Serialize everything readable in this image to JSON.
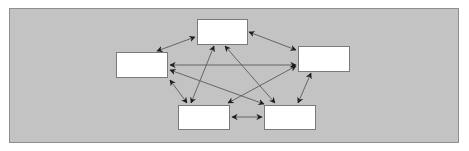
{
  "diagram": {
    "type": "fully-connected-network",
    "background_color": "#c3c3c3",
    "node_fill": "#ffffff",
    "edge_color": "#555555",
    "nodes": [
      {
        "id": "top",
        "label": "",
        "x": 197,
        "y": 19,
        "w": 51,
        "h": 26
      },
      {
        "id": "left",
        "label": "",
        "x": 116,
        "y": 52,
        "w": 52,
        "h": 26
      },
      {
        "id": "right",
        "label": "",
        "x": 298,
        "y": 46,
        "w": 52,
        "h": 26
      },
      {
        "id": "bottom-left",
        "label": "",
        "x": 178,
        "y": 105,
        "w": 52,
        "h": 25
      },
      {
        "id": "bottom-right",
        "label": "",
        "x": 264,
        "y": 105,
        "w": 52,
        "h": 25
      }
    ],
    "edges": [
      {
        "from": "top",
        "to": "left",
        "direction": "both"
      },
      {
        "from": "top",
        "to": "right",
        "direction": "both"
      },
      {
        "from": "left",
        "to": "bottom-left",
        "direction": "both"
      },
      {
        "from": "right",
        "to": "bottom-right",
        "direction": "both"
      },
      {
        "from": "bottom-left",
        "to": "bottom-right",
        "direction": "both"
      },
      {
        "from": "right",
        "to": "left",
        "direction": "both"
      },
      {
        "from": "bottom-left",
        "to": "top",
        "direction": "both"
      },
      {
        "from": "top",
        "to": "bottom-right",
        "direction": "both"
      },
      {
        "from": "left",
        "to": "bottom-right",
        "direction": "both"
      },
      {
        "from": "bottom-left",
        "to": "right",
        "direction": "both"
      }
    ]
  }
}
